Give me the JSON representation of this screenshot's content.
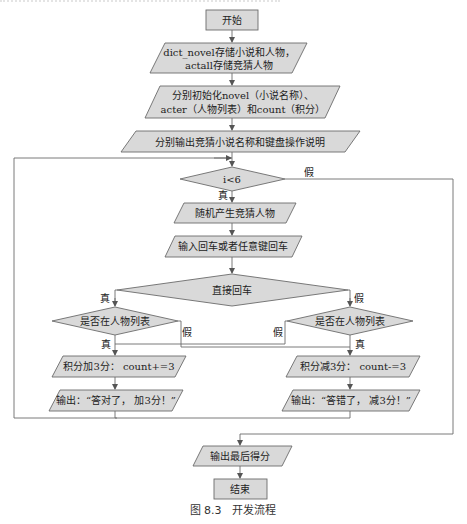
{
  "figure": {
    "caption": "图 8.3　开发流程",
    "colors": {
      "node_fill": "#d9d9d9",
      "stroke": "#6b6b6b",
      "text": "#222222"
    }
  },
  "nodes": {
    "start": "开始",
    "init_dict_line1": "dict_novel存储小说和人物，",
    "init_dict_line2": "actall存储竞猜人物",
    "init_vars_line1": "分别初始化novel（小说名称）、",
    "init_vars_line2": "acter（人物列表）和count（积分）",
    "output_intro": "分别输出竞猜小说名称和键盘操作说明",
    "loop_cond": "i<6",
    "random_pick": "随机产生竞猜人物",
    "input_key": "输入回车或者任意键回车",
    "enter_direct": "直接回车",
    "in_list_left": "是否在人物列表",
    "in_list_right": "是否在人物列表",
    "add_score": "积分加3分： count+=3",
    "sub_score": "积分减3分： count-=3",
    "output_right": "输出：“答对了， 加3分！”",
    "output_wrong": "输出：“答错了， 减3分！”",
    "output_final": "输出最后得分",
    "end": "结束"
  },
  "edge_labels": {
    "loop_false": "假",
    "loop_true": "真",
    "enter_true": "真",
    "enter_false": "假",
    "left_false": "假",
    "left_true": "真",
    "right_false": "假",
    "right_true": "真"
  }
}
